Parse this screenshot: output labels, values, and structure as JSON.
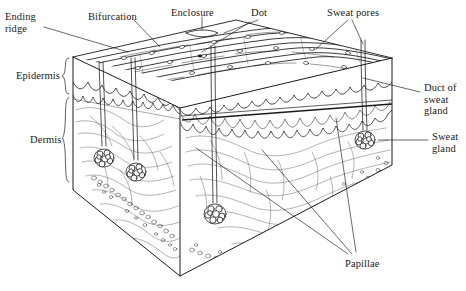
{
  "figure": {
    "type": "anatomical-line-diagram",
    "background_color": "#ffffff",
    "line_color": "#1a1a1a",
    "stipple_color": "#555555"
  },
  "labels": {
    "ending_ridge": "Ending\nridge",
    "bifurcation": "Bifurcation",
    "enclosure": "Enclosure",
    "dot": "Dot",
    "sweat_pores": "Sweat pores",
    "epidermis": "Epidermis",
    "dermis": "Dermis",
    "duct_of_sweat_gland": "Duct of\nsweat\ngland",
    "sweat_gland": "Sweat\ngland",
    "papillae": "Papillae"
  },
  "label_positions": {
    "ending_ridge": {
      "x": 5,
      "y": 11
    },
    "bifurcation": {
      "x": 88,
      "y": 11
    },
    "enclosure": {
      "x": 171,
      "y": 7
    },
    "dot": {
      "x": 251,
      "y": 7
    },
    "sweat_pores": {
      "x": 327,
      "y": 7
    },
    "epidermis": {
      "x": 16,
      "y": 70
    },
    "dermis": {
      "x": 30,
      "y": 134
    },
    "duct_of_sweat_gland": {
      "x": 424,
      "y": 82
    },
    "sweat_gland": {
      "x": 432,
      "y": 131
    },
    "papillae": {
      "x": 345,
      "y": 258
    }
  },
  "structures": [
    {
      "name": "friction-ridge-surface",
      "description": "Top face showing parallel friction ridges with sweat pore openings"
    },
    {
      "name": "epidermis-layer",
      "description": "Upper scalloped skin layer"
    },
    {
      "name": "papillae-boundary",
      "description": "Wavy dermal papillae junction"
    },
    {
      "name": "dermis-layer",
      "description": "Lower fibrous connective tissue layer"
    },
    {
      "name": "sweat-gland-coils",
      "description": "Coiled glands embedded in the dermis"
    },
    {
      "name": "sweat-ducts",
      "description": "Tubes connecting glands to surface pores"
    },
    {
      "name": "subcutaneous-stipple",
      "description": "Granular fatty layer at block base"
    }
  ],
  "minutiae_types": [
    "Ending ridge",
    "Bifurcation",
    "Enclosure",
    "Dot"
  ]
}
